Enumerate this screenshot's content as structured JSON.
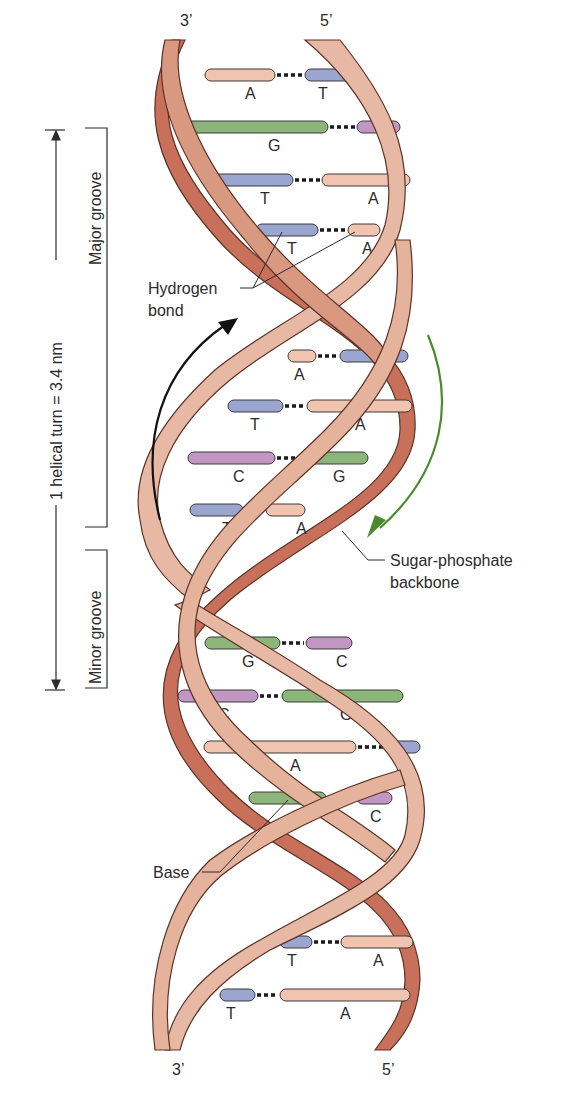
{
  "strand_ends": {
    "top_left": "3’",
    "top_right": "5’",
    "bottom_left": "3’",
    "bottom_right": "5’"
  },
  "labels": {
    "helical_turn": "1 helical turn = 3.4 nm",
    "major_groove": "Major groove",
    "minor_groove": "Minor groove",
    "hydrogen_bond_line1": "Hydrogen",
    "hydrogen_bond_line2": "bond",
    "backbone_line1": "Sugar-phosphate",
    "backbone_line2": "backbone",
    "base": "Base"
  },
  "colors": {
    "backbone_light": "#e7b9a4",
    "backbone_dark": "#c8705a",
    "backbone_edge": "#5a3328",
    "A": "#f0c4ae",
    "T": "#9aa6cf",
    "G": "#8cb57a",
    "C": "#c196c2",
    "arrow_left": "#111111",
    "arrow_right": "#4a8a2a"
  },
  "base_pairs": [
    {
      "left": "A",
      "right": "T",
      "y": 75,
      "lx1": 205,
      "lx2": 275,
      "rx1": 305,
      "rx2": 358,
      "tlx": 245,
      "trx": 318
    },
    {
      "left": "G",
      "right": "C",
      "y": 127,
      "lx1": 183,
      "lx2": 328,
      "rx1": 357,
      "rx2": 400,
      "tlx": 268,
      "trx": 382
    },
    {
      "left": "T",
      "right": "A",
      "y": 180,
      "lx1": 206,
      "lx2": 293,
      "rx1": 322,
      "rx2": 410,
      "tlx": 260,
      "trx": 368
    },
    {
      "left": "T",
      "right": "A",
      "y": 230,
      "lx1": 256,
      "lx2": 318,
      "rx1": 348,
      "rx2": 380,
      "tlx": 287,
      "trx": 362
    },
    {
      "left": "A",
      "right": "T",
      "y": 356,
      "lx1": 288,
      "lx2": 316,
      "rx1": 340,
      "rx2": 408,
      "tlx": 294,
      "trx": 372
    },
    {
      "left": "T",
      "right": "A",
      "y": 406,
      "lx1": 228,
      "lx2": 283,
      "rx1": 307,
      "rx2": 412,
      "tlx": 250,
      "trx": 355
    },
    {
      "left": "C",
      "right": "G",
      "y": 458,
      "lx1": 188,
      "lx2": 275,
      "rx1": 303,
      "rx2": 368,
      "tlx": 233,
      "trx": 333
    },
    {
      "left": "T",
      "right": "A",
      "y": 510,
      "lx1": 190,
      "lx2": 243,
      "rx1": 266,
      "rx2": 305,
      "tlx": 222,
      "trx": 296
    },
    {
      "left": "G",
      "right": "C",
      "y": 643,
      "lx1": 205,
      "lx2": 280,
      "rx1": 306,
      "rx2": 352,
      "tlx": 242,
      "trx": 336
    },
    {
      "left": "C",
      "right": "G",
      "y": 696,
      "lx1": 178,
      "lx2": 258,
      "rx1": 282,
      "rx2": 403,
      "tlx": 218,
      "trx": 340
    },
    {
      "left": "A",
      "right": "T",
      "y": 747,
      "lx1": 204,
      "lx2": 356,
      "rx1": 385,
      "rx2": 420,
      "tlx": 290,
      "trx": 400
    },
    {
      "left": "G",
      "right": "C",
      "y": 798,
      "lx1": 249,
      "lx2": 326,
      "rx1": 357,
      "rx2": 392,
      "tlx": 292,
      "trx": 370
    },
    {
      "left": "T",
      "right": "A",
      "y": 942,
      "lx1": 280,
      "lx2": 312,
      "rx1": 341,
      "rx2": 413,
      "tlx": 287,
      "trx": 373
    },
    {
      "left": "T",
      "right": "A",
      "y": 995,
      "lx1": 220,
      "lx2": 255,
      "rx1": 280,
      "rx2": 410,
      "tlx": 226,
      "trx": 340
    }
  ]
}
